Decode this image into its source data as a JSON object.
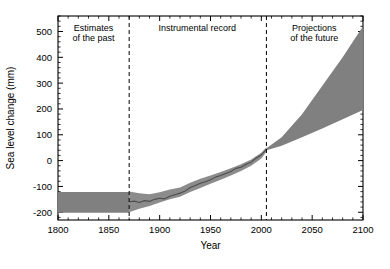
{
  "chart_data": {
    "type": "area",
    "title": "",
    "xlabel": "Year",
    "ylabel": "Sea level change (mm)",
    "xlim": [
      1800,
      2100
    ],
    "ylim": [
      -230,
      560
    ],
    "xticks": [
      1800,
      1850,
      1900,
      1950,
      2000,
      2050,
      2100
    ],
    "xtick_labels": [
      "1800",
      "1850",
      "1900",
      "1950",
      "2000",
      "2050",
      "2100"
    ],
    "yticks": [
      -200,
      -100,
      0,
      100,
      200,
      300,
      400,
      500
    ],
    "ytick_labels": [
      "-200",
      "-100",
      "0",
      "100",
      "200",
      "300",
      "400",
      "500"
    ],
    "minor_tick_interval_x": 10,
    "minor_tick_interval_y": 20,
    "grid": false,
    "legend": null,
    "annotations": [
      {
        "id": "estimates-of-the-past",
        "lines": [
          "Estimates",
          "of the past"
        ],
        "x": 1835,
        "y": 500
      },
      {
        "id": "instrumental-record",
        "lines": [
          "Instrumental record"
        ],
        "x": 1937,
        "y": 500
      },
      {
        "id": "projections-of-the-future",
        "lines": [
          "Projections",
          "of the future"
        ],
        "x": 2052,
        "y": 500
      }
    ],
    "dividers": [
      {
        "id": "divider-1870",
        "x": 1870,
        "style": "dashed"
      },
      {
        "id": "divider-2005",
        "x": 2005,
        "style": "dashed"
      }
    ],
    "series": [
      {
        "name": "Estimates of the past (uncertainty band)",
        "type": "band",
        "color": "#808080",
        "x": [
          1800,
          1870
        ],
        "upper": [
          -122,
          -122
        ],
        "lower": [
          -202,
          -202
        ]
      },
      {
        "name": "Instrumental record (uncertainty band)",
        "type": "band",
        "color": "#8c8c8c",
        "x": [
          1870,
          1880,
          1890,
          1900,
          1910,
          1920,
          1930,
          1940,
          1950,
          1960,
          1970,
          1980,
          1990,
          2000,
          2005
        ],
        "upper": [
          -120,
          -126,
          -130,
          -123,
          -112,
          -104,
          -86,
          -70,
          -58,
          -44,
          -30,
          -14,
          4,
          30,
          52
        ],
        "lower": [
          -200,
          -186,
          -176,
          -162,
          -150,
          -140,
          -122,
          -106,
          -90,
          -74,
          -58,
          -40,
          -20,
          8,
          34
        ]
      },
      {
        "name": "Instrumental record (mean)",
        "type": "line",
        "color": "#4d4d4d",
        "x": [
          1870,
          1875,
          1880,
          1885,
          1890,
          1895,
          1900,
          1905,
          1910,
          1915,
          1920,
          1925,
          1930,
          1935,
          1940,
          1945,
          1950,
          1955,
          1960,
          1965,
          1970,
          1975,
          1980,
          1985,
          1990,
          1995,
          2000,
          2005
        ],
        "y": [
          -160,
          -157,
          -162,
          -155,
          -158,
          -150,
          -146,
          -148,
          -138,
          -132,
          -126,
          -118,
          -104,
          -96,
          -88,
          -82,
          -74,
          -64,
          -58,
          -50,
          -42,
          -30,
          -26,
          -14,
          -6,
          10,
          22,
          44
        ]
      },
      {
        "name": "Projections of the future (range)",
        "type": "band",
        "color": "#808080",
        "x": [
          2005,
          2020,
          2040,
          2060,
          2080,
          2100
        ],
        "upper": [
          48,
          90,
          180,
          290,
          400,
          520
        ],
        "lower": [
          40,
          58,
          90,
          124,
          160,
          196
        ]
      }
    ]
  },
  "axes": {
    "y_axis_label": "Sea level change (mm)",
    "x_axis_label": "Year"
  }
}
